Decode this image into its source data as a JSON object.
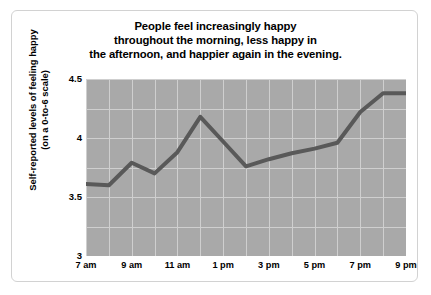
{
  "chart_data": {
    "type": "line",
    "title": "People feel increasingly happy throughout the morning, less happy in the afternoon, and happier again in the evening.",
    "title_lines": [
      "People feel increasingly happy",
      "throughout the morning, less happy in",
      "the afternoon, and happier again in the evening."
    ],
    "xlabel": "",
    "ylabel": "Self-reported levels of feeling happy (on a 0-to-6 scale)",
    "ylabel_lines": [
      "Self-reported levels of feeling happy",
      "(on a 0-to-6 scale)"
    ],
    "categories": [
      "7 am",
      "8 am",
      "9 am",
      "10 am",
      "11 am",
      "12 pm",
      "1 pm",
      "2 pm",
      "3 pm",
      "4 pm",
      "5 pm",
      "6 pm",
      "7 pm",
      "8 pm",
      "9 pm"
    ],
    "values": [
      3.61,
      3.6,
      3.79,
      3.7,
      3.88,
      4.18,
      3.97,
      3.76,
      3.82,
      3.87,
      3.91,
      3.96,
      4.22,
      4.38,
      4.38
    ],
    "ylim": [
      3,
      4.5
    ],
    "yticks": [
      "3",
      "3.5",
      "4",
      "4.5"
    ],
    "ytick_values": [
      3,
      3.5,
      4,
      4.5
    ],
    "xtick_labels": [
      "7 am",
      "9 am",
      "11 am",
      "1 pm",
      "3 pm",
      "5 pm",
      "7 pm",
      "9 pm"
    ],
    "xtick_indices": [
      0,
      2,
      4,
      6,
      8,
      10,
      12,
      14
    ],
    "grid": true,
    "legend": null,
    "colors": {
      "line": "#595959",
      "plot_background": "#a9a9a9",
      "gridline": "#cfcfcf",
      "figure_background": "#ffffff",
      "figure_border": "#d2d2d2",
      "text": "#000000"
    },
    "line_width": 4
  }
}
